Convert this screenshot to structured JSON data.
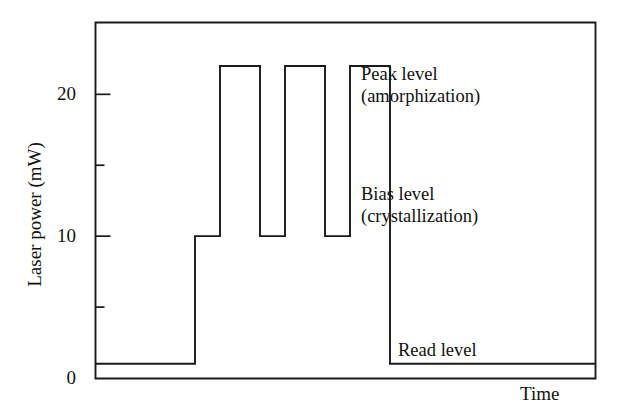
{
  "chart_data": {
    "type": "line",
    "title": "",
    "xlabel": "Time",
    "ylabel": "Laser power (mW)",
    "ylim": [
      0,
      25.1
    ],
    "xlim": [
      0,
      100
    ],
    "grid": false,
    "legend": "none",
    "y_ticks_major": [
      0,
      10,
      20
    ],
    "y_tick_labels": [
      "0",
      "10",
      "20"
    ],
    "y_ticks_minor": [
      5,
      15
    ],
    "x_ticks": [],
    "series": [
      {
        "name": "Laser power waveform",
        "step": "post",
        "x": [
          0,
          20,
          20,
          25,
          25,
          33,
          33,
          38,
          38,
          46,
          46,
          51,
          51,
          59,
          59,
          100
        ],
        "y": [
          1,
          1,
          10,
          10,
          22,
          22,
          10,
          10,
          22,
          22,
          10,
          10,
          22,
          22,
          1,
          1
        ]
      }
    ],
    "levels": {
      "read_level": 1,
      "bias_level": 10,
      "peak_level": 22
    },
    "annotations": [
      {
        "id": "peak",
        "lines": [
          "Peak level",
          "(amorphization)"
        ],
        "value": 22
      },
      {
        "id": "bias",
        "lines": [
          "Bias level",
          "(crystallization)"
        ],
        "value": 10
      },
      {
        "id": "read",
        "lines": [
          "Read level"
        ],
        "value": 1
      }
    ],
    "pulse_count": 3,
    "colors": {
      "line": "#1a1a1a",
      "frame": "#1a1a1a",
      "background": "#ffffff",
      "text": "#111111"
    }
  },
  "axes": {
    "y": {
      "title": "Laser power (mW)",
      "tick_labels": [
        "0",
        "10",
        "20"
      ]
    },
    "x": {
      "title": "Time"
    }
  },
  "annotations": {
    "peak": {
      "line1": "Peak level",
      "line2": "(amorphization)"
    },
    "bias": {
      "line1": "Bias level",
      "line2": "(crystallization)"
    },
    "read": {
      "line1": "Read level"
    }
  }
}
